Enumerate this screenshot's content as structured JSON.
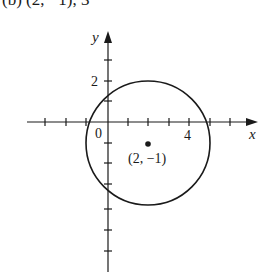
{
  "header": {
    "partial_text": "(b) (2, −1), 3"
  },
  "axes": {
    "x_label": "x",
    "y_label": "y",
    "origin_label": "0",
    "x_tick_label": "4",
    "y_tick_label": "2"
  },
  "circle": {
    "center": [
      2,
      -1
    ],
    "radius": 3,
    "center_label": "(2, −1)"
  },
  "colors": {
    "stroke": "#1a1a1a",
    "background": "#ffffff"
  }
}
